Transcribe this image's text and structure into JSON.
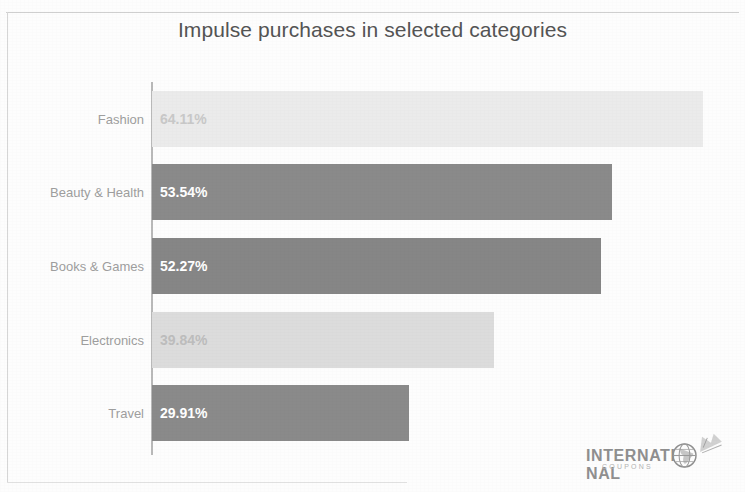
{
  "chart_data": {
    "type": "bar",
    "orientation": "horizontal",
    "title": "Impulse purchases in selected categories",
    "xlabel": "",
    "ylabel": "",
    "grid": false,
    "legend": null,
    "xlim": [
      0,
      67.5
    ],
    "categories": [
      "Fashion",
      "Beauty & Health",
      "Books & Games",
      "Electronics",
      "Travel"
    ],
    "values": [
      64.11,
      53.54,
      52.27,
      39.84,
      29.91
    ],
    "data_labels": [
      "64.11%",
      "53.54%",
      "52.27%",
      "39.84%",
      "29.91%"
    ],
    "bars": [
      {
        "category": "Fashion",
        "value": 64.11,
        "label": "64.11%",
        "color": "#ebebeb",
        "label_color": "#c8c8c8",
        "label_tone": "on-light"
      },
      {
        "category": "Beauty & Health",
        "value": 53.54,
        "label": "53.54%",
        "color": "#8a8a8a",
        "label_color": "#ffffff",
        "label_tone": "on-dark"
      },
      {
        "category": "Books & Games",
        "value": 52.27,
        "label": "52.27%",
        "color": "#868686",
        "label_color": "#ffffff",
        "label_tone": "on-dark"
      },
      {
        "category": "Electronics",
        "value": 39.84,
        "label": "39.84%",
        "color": "#dcdcdc",
        "label_color": "#bdbdbd",
        "label_tone": "on-light"
      },
      {
        "category": "Travel",
        "value": 29.91,
        "label": "29.91%",
        "color": "#8a8a8a",
        "label_color": "#ffffff",
        "label_tone": "on-dark"
      }
    ]
  },
  "colors": {
    "bar_light": "#ebebeb",
    "bar_dark": "#8a8a8a",
    "axis": "#b9b9b9",
    "title_text": "#545454",
    "category_text": "#9e9e9e",
    "background": "#fdfdfd"
  },
  "watermark": {
    "word": "INTERNATI",
    "word_tail": "NAL",
    "subtitle": "COUPONS",
    "globe_icon": "globe-icon",
    "spark_icon": "sparkle-icon"
  }
}
